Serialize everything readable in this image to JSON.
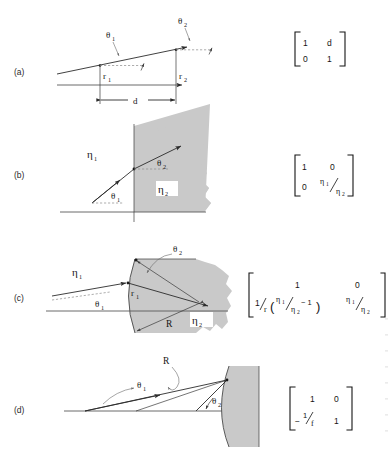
{
  "figure": {
    "background": "#ffffff",
    "medium_gray": "#c9c9c9",
    "ink": "#1a1a1a"
  },
  "panels": [
    {
      "id": "a",
      "label": "(a)",
      "description": "Translation of a ray through a distance d in a homogeneous medium",
      "labels": {
        "theta1": "θ",
        "theta1_sub": "1",
        "theta2": "θ",
        "theta2_sub": "2",
        "r1": "r",
        "r1_sub": "1",
        "r2": "r",
        "r2_sub": "2",
        "distance": "d"
      },
      "matrix": {
        "rows": [
          [
            "1",
            "d"
          ],
          [
            "0",
            "1"
          ]
        ]
      }
    },
    {
      "id": "b",
      "label": "(b)",
      "description": "Refraction at a planar interface between media of index eta1 and eta2",
      "labels": {
        "eta1": "η",
        "eta1_sub": "1",
        "eta2": "η",
        "eta2_sub": "2",
        "theta1": "θ",
        "theta1_sub": "1",
        "theta2": "θ",
        "theta2_sub": "2"
      },
      "matrix": {
        "r1c1": "1",
        "r1c2": "0",
        "r2c1": "0",
        "r2c2_num": "η",
        "r2c2_num_sub": "1",
        "r2c2_den": "η",
        "r2c2_den_sub": "2"
      }
    },
    {
      "id": "c",
      "label": "(c)",
      "description": "Refraction at a curved spherical interface of radius R",
      "labels": {
        "eta1": "η",
        "eta1_sub": "1",
        "eta2": "η",
        "eta2_sub": "2",
        "theta1": "θ",
        "theta1_sub": "1",
        "theta2": "θ",
        "theta2_sub": "2",
        "r1": "r",
        "r1_sub": "1",
        "radius": "R"
      },
      "matrix": {
        "r1c1": "1",
        "r1c2": "0",
        "r2c1_lead_num": "1",
        "r2c1_lead_den": "r",
        "r2c1_paren_open": "(",
        "r2c1_eta_num": "η",
        "r2c1_eta_num_sub": "1",
        "r2c1_eta_den": "η",
        "r2c1_eta_den_sub": "2",
        "r2c1_minus_one": "− 1",
        "r2c1_paren_close": ")",
        "r2c2_num": "η",
        "r2c2_num_sub": "1",
        "r2c2_den": "η",
        "r2c2_den_sub": "2"
      }
    },
    {
      "id": "d",
      "label": "(d)",
      "description": "Reflection from a concave spherical mirror of radius R",
      "labels": {
        "theta1": "θ",
        "theta1_sub": "1",
        "theta2": "θ",
        "theta2_sub": "2",
        "radius": "R"
      },
      "matrix": {
        "r1c1": "1",
        "r1c2": "0",
        "r2c1_sign": "−",
        "r2c1_num": "1",
        "r2c1_den": "f",
        "r2c2": "1"
      }
    }
  ]
}
